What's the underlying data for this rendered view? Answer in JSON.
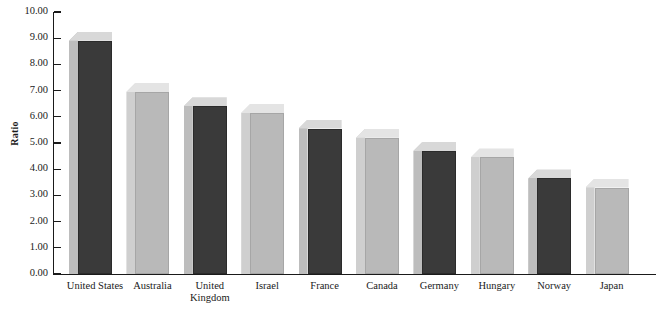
{
  "chart_data": {
    "type": "bar",
    "title": "",
    "xlabel": "",
    "ylabel": "Ratio",
    "ylim": [
      0,
      10
    ],
    "ytick_labels": [
      "10.00",
      "9.00",
      "8.00",
      "7.00",
      "6.00",
      "5.00",
      "4.00",
      "3.00",
      "2.00",
      "1.00",
      "0.00"
    ],
    "ytick_values": [
      10,
      9,
      8,
      7,
      6,
      5,
      4,
      3,
      2,
      1,
      0
    ],
    "grid": false,
    "legend": null,
    "style": "3d-bar",
    "categories": [
      "United States",
      "Australia",
      "United Kingdom",
      "Israel",
      "France",
      "Canada",
      "Germany",
      "Hungary",
      "Norway",
      "Japan"
    ],
    "values": [
      8.9,
      6.95,
      6.4,
      6.15,
      5.55,
      5.2,
      4.7,
      4.45,
      3.65,
      3.3
    ],
    "bar_colors": [
      "#3a3a3a",
      "#b9b9b9",
      "#3a3a3a",
      "#b9b9b9",
      "#3a3a3a",
      "#b9b9b9",
      "#3a3a3a",
      "#b9b9b9",
      "#3a3a3a",
      "#b9b9b9"
    ],
    "colors": {
      "dark_front": "#3a3a3a",
      "dark_top": "#d8d8d8",
      "dark_side": "#bdbdbd",
      "light_front": "#b9b9b9",
      "light_top": "#e4e4e4",
      "light_side": "#cfcfcf",
      "axis": "#1a1a1a",
      "background": "#ffffff"
    }
  }
}
